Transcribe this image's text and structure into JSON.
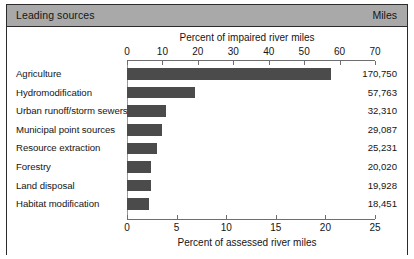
{
  "header": {
    "left_label": "Leading sources",
    "right_label": "Miles"
  },
  "chart_data": {
    "type": "bar",
    "orientation": "horizontal",
    "title": "",
    "categories": [
      "Agriculture",
      "Hydromodification",
      "Urban runoff/storm sewers",
      "Municipal point sources",
      "Resource extraction",
      "Forestry",
      "Land disposal",
      "Habitat modification"
    ],
    "values": [
      20.6,
      6.9,
      3.9,
      3.5,
      3.0,
      2.4,
      2.4,
      2.2
    ],
    "miles": [
      "170,750",
      "57,763",
      "32,310",
      "29,087",
      "25,231",
      "20,020",
      "19,928",
      "18,451"
    ],
    "top_axis": {
      "label": "Percent of impaired river miles",
      "ticks": [
        0,
        10,
        20,
        30,
        40,
        50,
        60,
        70
      ],
      "range": [
        0,
        70
      ]
    },
    "bottom_axis": {
      "label": "Percent of assessed river miles",
      "ticks": [
        0,
        5,
        10,
        15,
        20,
        25
      ],
      "range": [
        0,
        25
      ]
    },
    "xlabel": "Percent of assessed river miles",
    "ylabel": "",
    "grid": false,
    "legend": "none",
    "bar_color": "#4b4b4b",
    "header_color": "#a9a9a9",
    "border_color": "#2b2b2b"
  }
}
